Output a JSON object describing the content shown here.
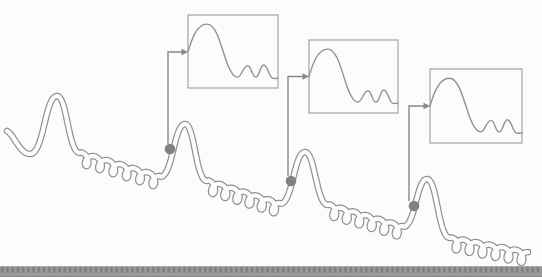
{
  "figure": {
    "canvas": {
      "width": 542,
      "height": 277,
      "background": "#fcfcfc"
    },
    "wave": {
      "stroke": "#8f9093",
      "core": "#fcfcfc",
      "outer_width": 6.6,
      "inner_width": 4.2,
      "coil_rx": 4.6,
      "coil_ry": 6.0,
      "coil_lift": 0.85,
      "segments": [
        {
          "type": "lead",
          "from": [
            7,
            131
          ],
          "to": [
            30,
            154
          ]
        },
        {
          "type": "peak",
          "left": [
            30,
            154
          ],
          "apex": [
            57,
            96
          ],
          "right": [
            80,
            153
          ]
        },
        {
          "type": "coil",
          "from": [
            80,
            153
          ],
          "to": [
            160,
            177
          ],
          "loops": 6
        },
        {
          "type": "peak",
          "left": [
            160,
            177
          ],
          "apex": [
            185,
            124
          ],
          "right": [
            207,
            181
          ]
        },
        {
          "type": "coil",
          "from": [
            207,
            181
          ],
          "to": [
            280,
            204
          ],
          "loops": 6
        },
        {
          "type": "peak",
          "left": [
            280,
            204
          ],
          "apex": [
            305,
            152
          ],
          "right": [
            328,
            205
          ]
        },
        {
          "type": "coil",
          "from": [
            328,
            205
          ],
          "to": [
            403,
            227
          ],
          "loops": 6
        },
        {
          "type": "peak",
          "left": [
            403,
            227
          ],
          "apex": [
            427,
            179
          ],
          "right": [
            450,
            238
          ]
        },
        {
          "type": "coil",
          "from": [
            450,
            238
          ],
          "to": [
            528,
            253
          ],
          "loops": 6
        }
      ]
    },
    "markers": {
      "color": "#808184",
      "radius": 5.3,
      "points": [
        [
          170,
          149
        ],
        [
          291,
          181
        ],
        [
          414,
          206
        ]
      ]
    },
    "connectors": {
      "color": "#87898c",
      "width": 1.4,
      "arrow_length": 6.5,
      "arrow_halfwidth": 3.2,
      "items": [
        {
          "start": [
            168,
            144
          ],
          "corner": [
            168,
            52
          ],
          "tip": [
            188,
            52
          ]
        },
        {
          "start": [
            288,
            176
          ],
          "corner": [
            288,
            76.5
          ],
          "tip": [
            309,
            76.5
          ]
        },
        {
          "start": [
            409,
            201
          ],
          "corner": [
            409,
            106
          ],
          "tip": [
            430,
            106
          ]
        }
      ]
    },
    "insets": {
      "border": "#9b9b9b",
      "border_width": 1.1,
      "fill": "#fcfcfc",
      "curve_color": "#8d9296",
      "curve_width": 1.4,
      "boxes": [
        {
          "x": 188,
          "y": 15,
          "w": 90,
          "h": 73
        },
        {
          "x": 309,
          "y": 40,
          "w": 89,
          "h": 73
        },
        {
          "x": 430,
          "y": 69,
          "w": 92,
          "h": 74
        }
      ],
      "curve": {
        "start": [
          0,
          0.5
        ],
        "cubics": [
          [
            0.035,
            0.36,
            0.09,
            0.125,
            0.21,
            0.125
          ],
          [
            0.315,
            0.125,
            0.365,
            0.42,
            0.425,
            0.63
          ],
          [
            0.465,
            0.77,
            0.505,
            0.85,
            0.55,
            0.85
          ],
          [
            0.595,
            0.85,
            0.615,
            0.695,
            0.663,
            0.695
          ],
          [
            0.705,
            0.695,
            0.71,
            0.85,
            0.752,
            0.85
          ],
          [
            0.795,
            0.85,
            0.8,
            0.685,
            0.842,
            0.685
          ],
          [
            0.885,
            0.685,
            0.9,
            0.862,
            0.945,
            0.868
          ],
          [
            0.965,
            0.87,
            0.985,
            0.868,
            1.0,
            0.865
          ]
        ]
      }
    },
    "bottom_bar": {
      "bg": "#9b9b9b",
      "tick": "#7f7f7f",
      "tick_width": 2.6,
      "tick_period": 5.2,
      "y": 266,
      "height": 11,
      "top_edge": "#aaaaaa",
      "bottom_edge": "#858585"
    }
  }
}
